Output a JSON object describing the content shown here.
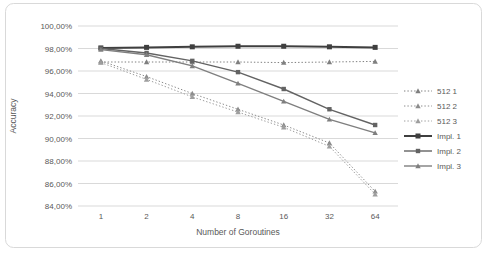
{
  "window": {
    "background": "#ffffff",
    "frame_border_color": "#d9d9d9"
  },
  "chart_data": {
    "type": "line",
    "title": "",
    "xlabel": "Number of Goroutines",
    "ylabel": "Accuracy",
    "x_categories": [
      "1",
      "2",
      "4",
      "8",
      "16",
      "32",
      "64"
    ],
    "y_tick_labels": [
      "100,00%",
      "98,00%",
      "96,00%",
      "94,00%",
      "92,00%",
      "90,00%",
      "88,00%",
      "86,00%",
      "84,00%"
    ],
    "ylim": [
      84,
      100
    ],
    "y_step": 2,
    "y_axis_format": "percent with comma decimal separator",
    "grid": "horizontal",
    "legend_position": "right-middle",
    "axis_text_color": "#595959",
    "gridline_color": "#d9d9d9",
    "series": [
      {
        "name": "512 1",
        "values": [
          96.8,
          96.8,
          96.8,
          96.8,
          96.75,
          96.8,
          96.85
        ],
        "line_style": "dotted",
        "marker": "triangle",
        "color": "#7f7f7f",
        "width": 1
      },
      {
        "name": "512 2",
        "values": [
          96.9,
          95.5,
          94.0,
          92.6,
          91.2,
          89.6,
          85.3
        ],
        "line_style": "dotted",
        "marker": "triangle",
        "color": "#8c8c8c",
        "width": 1
      },
      {
        "name": "512 3",
        "values": [
          96.75,
          95.25,
          93.7,
          92.35,
          91.0,
          89.3,
          85.05
        ],
        "line_style": "dotted",
        "marker": "triangle",
        "color": "#9e9e9e",
        "width": 1
      },
      {
        "name": "Impl. 1",
        "values": [
          98.05,
          98.1,
          98.15,
          98.2,
          98.2,
          98.15,
          98.1
        ],
        "line_style": "solid",
        "marker": "square",
        "color": "#3f3f3f",
        "width": 2
      },
      {
        "name": "Impl. 2",
        "values": [
          98.0,
          97.6,
          96.9,
          95.9,
          94.4,
          92.6,
          91.2
        ],
        "line_style": "solid",
        "marker": "square",
        "color": "#636363",
        "width": 1.4
      },
      {
        "name": "Impl. 3",
        "values": [
          97.9,
          97.45,
          96.45,
          94.9,
          93.3,
          91.7,
          90.5
        ],
        "line_style": "solid",
        "marker": "triangle",
        "color": "#7f7f7f",
        "width": 1.4
      }
    ]
  }
}
